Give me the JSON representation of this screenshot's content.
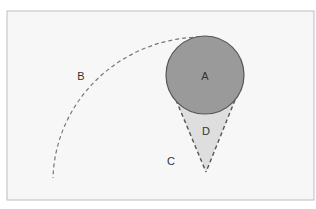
{
  "diagram": {
    "frame": {
      "x": 7,
      "y": 11,
      "width": 307,
      "height": 189,
      "fill": "#f7f7f7",
      "stroke": "#bdbdbd"
    },
    "circle": {
      "label": "A",
      "cx": 205,
      "cy": 75,
      "r": 39,
      "fill": "#9a9a9a",
      "stroke": "#555555"
    },
    "arc": {
      "label": "B",
      "path": "M 200 37 A 150 145 0 0 0 53 178",
      "stroke": "#777777"
    },
    "region_c": {
      "label": "C"
    },
    "cone": {
      "label": "D",
      "points": "176,100 206,172 235,100",
      "fill": "#dedede",
      "stroke": "#555555"
    },
    "labels": [
      {
        "id": "A",
        "text": "A",
        "x": 205,
        "y": 80
      },
      {
        "id": "B",
        "text": "B",
        "x": 81,
        "y": 80
      },
      {
        "id": "C",
        "text": "C",
        "x": 171,
        "y": 165
      },
      {
        "id": "D",
        "text": "D",
        "x": 206,
        "y": 135
      }
    ]
  }
}
